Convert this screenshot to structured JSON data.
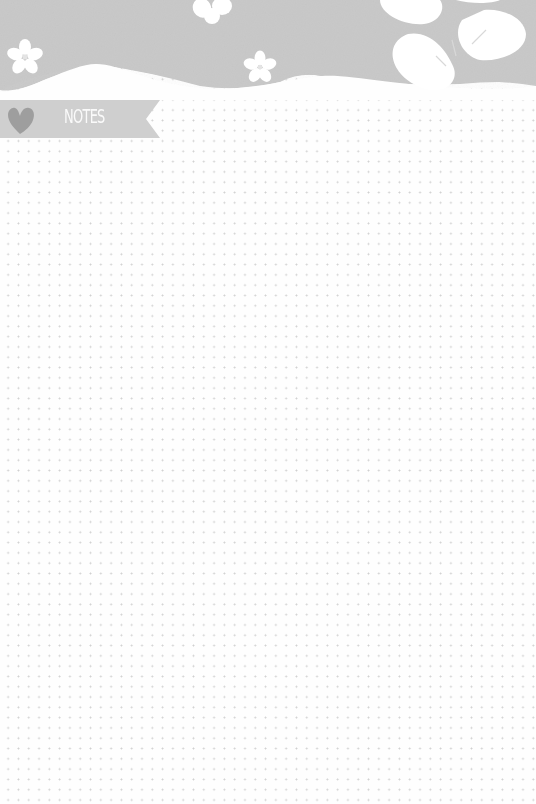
{
  "page": {
    "title": "NOTES",
    "layout": "dot-grid",
    "colors": {
      "header": "#c9c9c9",
      "banner": "#cfcfcf",
      "heart": "#9e9e9e",
      "dots": "#cfcfcf",
      "paper": "#fefefe",
      "flowers": "#ffffff"
    },
    "decorations": [
      "hibiscus-flower",
      "plumeria-flowers",
      "scalloped-header",
      "heart-icon"
    ]
  }
}
